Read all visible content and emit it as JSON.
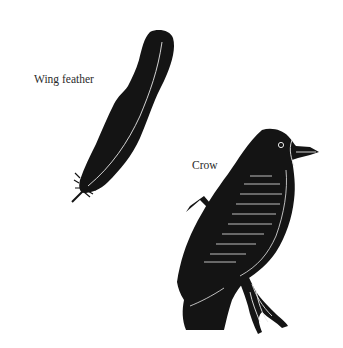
{
  "figure": {
    "labels": {
      "wing_feather": "Wing feather",
      "crow": "Crow"
    },
    "items": [
      {
        "id": "wing-feather",
        "label": "Wing feather",
        "kind": "illustration"
      },
      {
        "id": "crow",
        "label": "Crow",
        "kind": "illustration"
      }
    ],
    "colors": {
      "background": "#ffffff",
      "ink": "#141414",
      "highlight": "#e8e8e8",
      "text": "#2a2a2a"
    }
  }
}
